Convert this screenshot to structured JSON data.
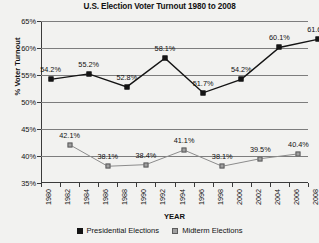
{
  "chart_data": {
    "type": "line",
    "title": "U.S. Election Voter Turnout 1980 to 2008",
    "xlabel": "YEAR",
    "ylabel": "% Voter Turnout",
    "ylim": [
      35,
      65
    ],
    "ytick_step": 5,
    "ytick_labels": [
      "65%",
      "60%",
      "55%",
      "50%",
      "45%",
      "40%",
      "35%"
    ],
    "ytick_values": [
      65,
      60,
      55,
      50,
      45,
      40,
      35
    ],
    "xlim": [
      1980,
      2008
    ],
    "xtick_labels": [
      "1980",
      "1982",
      "1984",
      "1986",
      "1988",
      "1990",
      "1992",
      "1994",
      "1996",
      "1998",
      "2000",
      "2002",
      "2004",
      "2006",
      "2008"
    ],
    "grid": true,
    "legend_position": "bottom",
    "series": [
      {
        "name": "Presidential Elections",
        "color": "#141414",
        "x": [
          1980,
          1984,
          1988,
          1992,
          1996,
          2000,
          2004,
          2008
        ],
        "values": [
          54.2,
          55.2,
          52.8,
          58.1,
          51.7,
          54.2,
          60.1,
          61.6
        ],
        "labels": [
          "54.2%",
          "55.2%",
          "52.8%",
          "58.1%",
          "51.7%",
          "54.2%",
          "60.1%",
          "61.6%"
        ]
      },
      {
        "name": "Midterm Elections",
        "color": "#a0a0a0",
        "x": [
          1982,
          1986,
          1990,
          1994,
          1998,
          2002,
          2006
        ],
        "values": [
          42.1,
          38.1,
          38.4,
          41.1,
          38.1,
          39.5,
          40.4
        ],
        "labels": [
          "42.1%",
          "38.1%",
          "38.4%",
          "41.1%",
          "38.1%",
          "39.5%",
          "40.4%"
        ]
      }
    ]
  },
  "legend": {
    "entries": [
      {
        "label": "Presidential Elections"
      },
      {
        "label": "Midterm Elections"
      }
    ]
  }
}
